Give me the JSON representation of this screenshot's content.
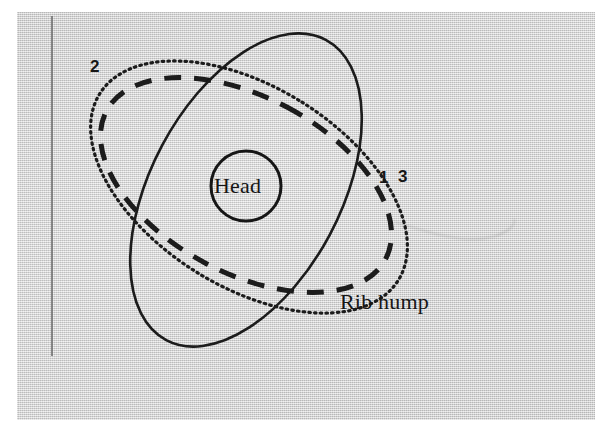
{
  "figure": {
    "kind": "vertebral-rotation-diagram",
    "background_color": "#d6d6d6",
    "page_color": "#ffffff",
    "ink_color": "#1a1a1a",
    "plate": {
      "x": 17,
      "y": 12,
      "width": 578,
      "height": 408
    }
  },
  "axis": {
    "name": "vertical-reference-line",
    "color": "#6e6e6e",
    "x": 52,
    "y_top": 16,
    "y_bottom": 356
  },
  "center_marker": {
    "label": "Head",
    "shape": "circle",
    "cx": 246,
    "cy": 186,
    "r": 35,
    "stroke_width": 3
  },
  "annotations": [
    {
      "id": "callout-rib-hump",
      "label": "Rib hump",
      "x": 340,
      "y": 291
    }
  ],
  "curve_labels": [
    {
      "id": "curve-label-2",
      "label": "2",
      "x": 90,
      "y": 58,
      "curve": "outline-2"
    },
    {
      "id": "curve-label-1",
      "label": "1",
      "x": 379,
      "y": 169,
      "curve": "outline-1"
    },
    {
      "id": "curve-label-3",
      "label": "3",
      "x": 398,
      "y": 168,
      "curve": "outline-3"
    }
  ],
  "curves": [
    {
      "id": "outline-2",
      "label": "2",
      "style": "solid",
      "stroke_width": 2.6,
      "dasharray": "",
      "cx": 246,
      "cy": 190,
      "rx": 95,
      "ry": 170,
      "rotation_deg": 28
    },
    {
      "id": "outline-1",
      "label": "1",
      "style": "dashed",
      "stroke_width": 5,
      "dasharray": "17 13",
      "cx": 246,
      "cy": 185,
      "rx": 88,
      "ry": 158,
      "rotation_deg": -62
    },
    {
      "id": "outline-3",
      "label": "3",
      "style": "dotted",
      "stroke_width": 3.2,
      "dasharray": "1.5 4.2",
      "cx": 249,
      "cy": 187,
      "rx": 100,
      "ry": 176,
      "rotation_deg": -58
    }
  ],
  "artifacts": [
    {
      "id": "scan-scratch",
      "description": "faint scan crease",
      "opacity": 0.3
    }
  ]
}
